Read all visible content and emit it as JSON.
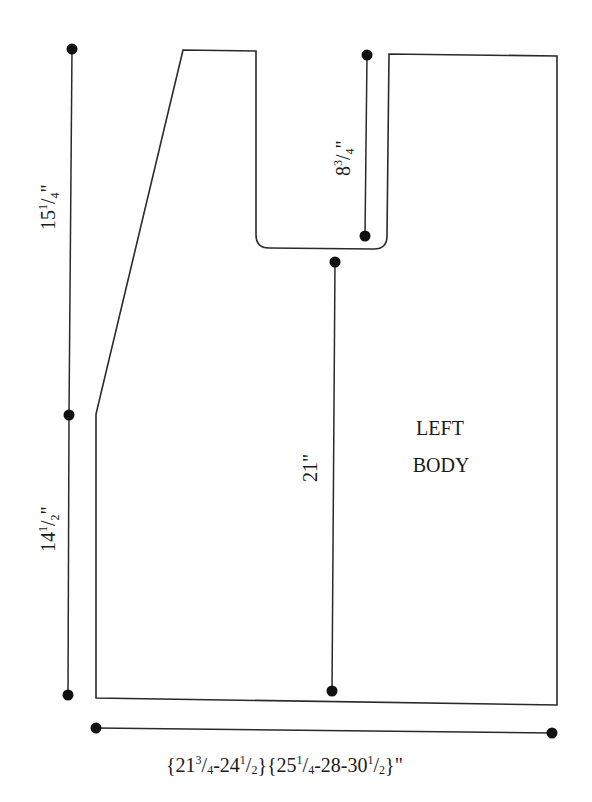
{
  "diagram": {
    "title": "LEFT BODY",
    "piece_label_lines": [
      "LEFT",
      "BODY"
    ],
    "colors": {
      "line": "#2a2a2a",
      "dot": "#111111",
      "text": "#1a1a1a",
      "background": "#ffffff"
    },
    "measurements": {
      "upper_side": {
        "whole": "15",
        "num": "1",
        "den": "4",
        "unit": "\""
      },
      "lower_side": {
        "whole": "14",
        "num": "1",
        "den": "2",
        "unit": "\""
      },
      "neck_depth": {
        "whole": "8",
        "num": "3",
        "den": "4",
        "unit": "\""
      },
      "center_length": {
        "text": "21\""
      },
      "width": {
        "g1a_whole": "21",
        "g1a_num": "3",
        "g1a_den": "4",
        "g1b_whole": "24",
        "g1b_num": "1",
        "g1b_den": "2",
        "g2a_whole": "25",
        "g2a_num": "1",
        "g2a_den": "4",
        "g2b": "28",
        "g2c_whole": "30",
        "g2c_num": "1",
        "g2c_den": "2",
        "full_text": "{21 3/4-24 1/2}{25 1/4-28-30 1/2}\""
      }
    }
  }
}
